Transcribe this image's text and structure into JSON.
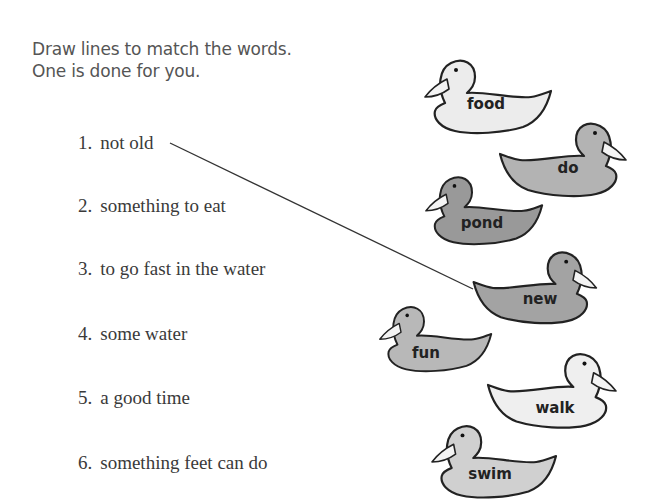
{
  "instructions": {
    "line1": "Draw lines to match the words.",
    "line2": "One is done for you."
  },
  "clues": [
    {
      "number": "1.",
      "text": "not old"
    },
    {
      "number": "2.",
      "text": "something to eat"
    },
    {
      "number": "3.",
      "text": "to go fast in the water"
    },
    {
      "number": "4.",
      "text": "some water"
    },
    {
      "number": "5.",
      "text": "a good time"
    },
    {
      "number": "6.",
      "text": "something feet can do"
    }
  ],
  "ducks": [
    {
      "word": "food",
      "facing": "left",
      "fill": "#ececec"
    },
    {
      "word": "do",
      "facing": "right",
      "fill": "#b3b3b3"
    },
    {
      "word": "pond",
      "facing": "left",
      "fill": "#999999"
    },
    {
      "word": "new",
      "facing": "right",
      "fill": "#a3a3a3"
    },
    {
      "word": "fun",
      "facing": "left",
      "fill": "#b8b8b8"
    },
    {
      "word": "walk",
      "facing": "right",
      "fill": "#efefef"
    },
    {
      "word": "swim",
      "facing": "left",
      "fill": "#d0d0d0"
    }
  ],
  "example_match": {
    "clue": "not old",
    "word": "new"
  }
}
